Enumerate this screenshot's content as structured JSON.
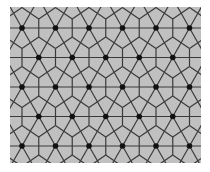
{
  "figure": {
    "canvas": {
      "width": 210,
      "height": 172
    },
    "panel": {
      "x": 10,
      "y": 7,
      "width": 191,
      "height": 156
    },
    "colors": {
      "page": "#ffffff",
      "fill": "#c0c0c0",
      "line": "#3a3a3a",
      "dot": "#111111"
    },
    "line_width": 1.2,
    "dot_radius": 2.8,
    "spacing_x": 33.5,
    "dot_rows": [
      {
        "y": -1.5,
        "start_x": 5.25
      },
      {
        "y": 28,
        "start_x": 22
      },
      {
        "y": 57.5,
        "start_x": 5.25
      },
      {
        "y": 87,
        "start_x": 22
      },
      {
        "y": 116.5,
        "start_x": 5.25
      },
      {
        "y": 146,
        "start_x": 22
      },
      {
        "y": 175.5,
        "start_x": 5.25
      }
    ],
    "tile": {
      "dx": 8.4,
      "dy": 14.75,
      "stem": 9
    }
  }
}
